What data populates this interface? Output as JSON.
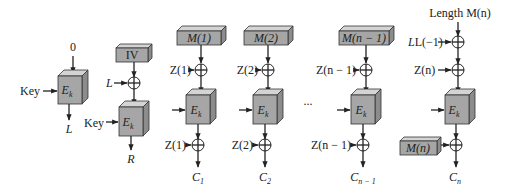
{
  "diagram": {
    "title": "",
    "colors": {
      "box_front": "#a6a6a6",
      "box_top": "#d4d4d4",
      "box_side": "#8c8c8c",
      "line": "#222222"
    },
    "setup1": {
      "input_label": "0",
      "key_label": "Key",
      "cipher_label": "E",
      "cipher_sub": "k",
      "output_label": "L"
    },
    "setup2": {
      "iv_label": "IV",
      "xor_input_label": "L",
      "key_label": "Key",
      "cipher_label": "E",
      "cipher_sub": "k",
      "output_label": "R"
    },
    "columns": [
      {
        "message_label": "M(1)",
        "pre_xor_label": "Z(1)",
        "post_xor_label": "Z(1)",
        "cipher_label": "E",
        "cipher_sub": "k",
        "output_label": "C",
        "output_sub": "1"
      },
      {
        "message_label": "M(2)",
        "pre_xor_label": "Z(2)",
        "post_xor_label": "Z(2)",
        "cipher_label": "E",
        "cipher_sub": "k",
        "output_label": "C",
        "output_sub": "2"
      },
      {
        "message_label": "M(n − 1)",
        "pre_xor_label": "Z(n − 1)",
        "post_xor_label": "Z(n − 1)",
        "cipher_label": "E",
        "cipher_sub": "k",
        "output_label": "C",
        "output_sub": "n − 1"
      }
    ],
    "ellipsis": "...",
    "final": {
      "length_label": "Length M(n)",
      "xor1_label": "L(−1)",
      "xor2_label": "Z(n)",
      "cipher_label": "E",
      "cipher_sub": "k",
      "message_label": "M(n)",
      "output_label": "C",
      "output_sub": "n"
    }
  }
}
